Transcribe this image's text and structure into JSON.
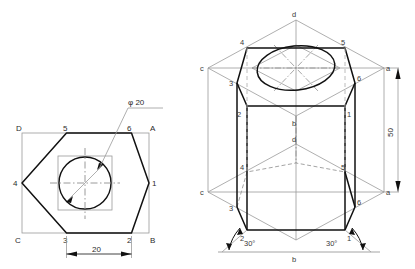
{
  "drawing": {
    "title": "Hexagonal prism with central circular hole - orthographic and isometric views",
    "colors": {
      "object_line": "#111111",
      "construction_line": "#9a9a9a",
      "center_line": "#8e8e8e",
      "hidden_line": "#9a9a9a",
      "text": "#2b2b2b",
      "background": "#ffffff"
    }
  },
  "ortho_view": {
    "name": "front-view",
    "square_labels": {
      "top_left": "D",
      "top_right": "A",
      "bottom_right": "B",
      "bottom_left": "C"
    },
    "hex_labels": {
      "v1": "1",
      "v2": "2",
      "v3": "3",
      "v4": "4",
      "v5": "5",
      "v6": "6"
    },
    "diameter_label": "φ 20",
    "width_dimension": "20"
  },
  "iso_view": {
    "name": "isometric-view",
    "top_labels": {
      "a": "a",
      "b": "b",
      "c": "c",
      "d": "d"
    },
    "bottom_labels": {
      "a": "a",
      "b": "b",
      "c": "c",
      "d": "d"
    },
    "top_hex_labels": {
      "v1": "1",
      "v2": "2",
      "v3": "3",
      "v4": "4",
      "v5": "5",
      "v6": "6"
    },
    "bottom_hex_labels": {
      "v1": "1",
      "v2": "2",
      "v3": "3",
      "v4": "4",
      "v5": "5",
      "v6": "6"
    },
    "height_dimension": "50",
    "angle_left": "30°",
    "angle_right": "30°"
  }
}
